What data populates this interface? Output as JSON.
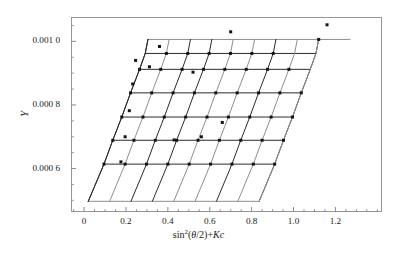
{
  "figure": {
    "kind": "zimm-plot",
    "background": "#ffffff"
  },
  "axes": {
    "x_label_parts": {
      "fn": "sin",
      "exponent": "2",
      "open": "(",
      "theta": "θ",
      "half": "/2",
      "close": ")",
      "plus": "+",
      "K": "K",
      "c": "c"
    },
    "y_label": "Y",
    "frame_color": "#8c8c8c",
    "tick_color": "#6e6e6e",
    "x_ticks": [
      {
        "value": 0,
        "label": "0"
      },
      {
        "value": 0.2,
        "label": "0.2"
      },
      {
        "value": 0.4,
        "label": "0.4"
      },
      {
        "value": 0.6,
        "label": "0.6"
      },
      {
        "value": 0.8,
        "label": "0.8"
      },
      {
        "value": 1.0,
        "label": "1.0"
      },
      {
        "value": 1.2,
        "label": "1.2"
      }
    ],
    "y_ticks": [
      {
        "value": 0.001,
        "label": "0.001 0"
      },
      {
        "value": 0.0008,
        "label": "0.000 8"
      },
      {
        "value": 0.0006,
        "label": "0.000 6"
      }
    ]
  },
  "chart_data": {
    "type": "scatter",
    "title": "",
    "xlabel": "sin²(θ/2)+Kc",
    "ylabel": "Y",
    "xlim": [
      -0.06,
      1.42
    ],
    "ylim": [
      0.000465,
      0.001075
    ],
    "grid": false,
    "legend": null,
    "marker": "filled-square",
    "marker_size_px": 3.0,
    "line_colors": [
      "#2b2b2b",
      "#8f8f8f"
    ],
    "angle_lines": [
      {
        "name": "c1",
        "color": "#2b2b2b",
        "points": [
          [
            0.02,
            0.000497
          ],
          [
            0.095,
            0.000614
          ],
          [
            0.137,
            0.000689
          ],
          [
            0.18,
            0.000762
          ],
          [
            0.222,
            0.000838
          ],
          [
            0.265,
            0.000912
          ],
          [
            0.292,
            0.000962
          ],
          [
            0.305,
            0.001006
          ]
        ]
      },
      {
        "name": "c2",
        "color": "#8f8f8f",
        "points": [
          [
            0.122,
            0.000497
          ],
          [
            0.196,
            0.000614
          ],
          [
            0.238,
            0.000689
          ],
          [
            0.281,
            0.000762
          ],
          [
            0.323,
            0.000838
          ],
          [
            0.366,
            0.000912
          ],
          [
            0.393,
            0.000962
          ],
          [
            0.406,
            0.001006
          ]
        ]
      },
      {
        "name": "c3",
        "color": "#2b2b2b",
        "points": [
          [
            0.224,
            0.000497
          ],
          [
            0.298,
            0.000614
          ],
          [
            0.34,
            0.000689
          ],
          [
            0.383,
            0.000762
          ],
          [
            0.425,
            0.000838
          ],
          [
            0.468,
            0.000912
          ],
          [
            0.495,
            0.000962
          ],
          [
            0.508,
            0.001006
          ]
        ]
      },
      {
        "name": "c4",
        "color": "#2b2b2b",
        "points": [
          [
            0.326,
            0.000497
          ],
          [
            0.4,
            0.000614
          ],
          [
            0.442,
            0.000689
          ],
          [
            0.485,
            0.000762
          ],
          [
            0.527,
            0.000838
          ],
          [
            0.57,
            0.000912
          ],
          [
            0.597,
            0.000962
          ],
          [
            0.61,
            0.001006
          ]
        ]
      },
      {
        "name": "c5",
        "color": "#8f8f8f",
        "points": [
          [
            0.428,
            0.000497
          ],
          [
            0.502,
            0.000614
          ],
          [
            0.544,
            0.000689
          ],
          [
            0.587,
            0.000762
          ],
          [
            0.629,
            0.000838
          ],
          [
            0.672,
            0.000912
          ],
          [
            0.699,
            0.000962
          ],
          [
            0.712,
            0.001006
          ]
        ]
      },
      {
        "name": "c6",
        "color": "#8f8f8f",
        "points": [
          [
            0.53,
            0.000497
          ],
          [
            0.604,
            0.000614
          ],
          [
            0.646,
            0.000689
          ],
          [
            0.689,
            0.000762
          ],
          [
            0.731,
            0.000838
          ],
          [
            0.774,
            0.000912
          ],
          [
            0.801,
            0.000962
          ],
          [
            0.814,
            0.001006
          ]
        ]
      },
      {
        "name": "c7",
        "color": "#2b2b2b",
        "points": [
          [
            0.632,
            0.000497
          ],
          [
            0.706,
            0.000614
          ],
          [
            0.748,
            0.000689
          ],
          [
            0.791,
            0.000762
          ],
          [
            0.833,
            0.000838
          ],
          [
            0.876,
            0.000912
          ],
          [
            0.903,
            0.000962
          ],
          [
            0.916,
            0.001006
          ]
        ]
      },
      {
        "name": "c8",
        "color": "#8f8f8f",
        "points": [
          [
            0.734,
            0.000497
          ],
          [
            0.808,
            0.000614
          ],
          [
            0.85,
            0.000689
          ],
          [
            0.893,
            0.000762
          ],
          [
            0.935,
            0.000838
          ],
          [
            0.978,
            0.000912
          ],
          [
            1.005,
            0.000962
          ],
          [
            1.018,
            0.001006
          ]
        ]
      },
      {
        "name": "c9",
        "color": "#2b2b2b",
        "points": [
          [
            0.836,
            0.000497
          ],
          [
            0.91,
            0.000614
          ],
          [
            0.952,
            0.000689
          ],
          [
            0.995,
            0.000762
          ],
          [
            1.037,
            0.000838
          ],
          [
            1.08,
            0.000912
          ],
          [
            1.107,
            0.000962
          ],
          [
            1.12,
            0.001006
          ]
        ]
      }
    ],
    "concentration_lines": [
      {
        "name": "q0",
        "color": "#8f8f8f",
        "points": [
          [
            0.02,
            0.000497
          ],
          [
            0.122,
            0.000497
          ],
          [
            0.224,
            0.000497
          ],
          [
            0.326,
            0.000497
          ],
          [
            0.428,
            0.000497
          ],
          [
            0.53,
            0.000497
          ],
          [
            0.632,
            0.000497
          ],
          [
            0.734,
            0.000497
          ],
          [
            0.836,
            0.000497
          ]
        ]
      },
      {
        "name": "q1",
        "color": "#2b2b2b",
        "points": [
          [
            0.095,
            0.000614
          ],
          [
            0.196,
            0.000614
          ],
          [
            0.298,
            0.000614
          ],
          [
            0.4,
            0.000614
          ],
          [
            0.502,
            0.000614
          ],
          [
            0.604,
            0.000614
          ],
          [
            0.706,
            0.000614
          ],
          [
            0.808,
            0.000614
          ],
          [
            0.91,
            0.000614
          ]
        ]
      },
      {
        "name": "q2",
        "color": "#2b2b2b",
        "points": [
          [
            0.137,
            0.000689
          ],
          [
            0.238,
            0.000689
          ],
          [
            0.34,
            0.000689
          ],
          [
            0.442,
            0.000689
          ],
          [
            0.544,
            0.000689
          ],
          [
            0.646,
            0.000689
          ],
          [
            0.748,
            0.000689
          ],
          [
            0.85,
            0.000689
          ],
          [
            0.952,
            0.000689
          ]
        ]
      },
      {
        "name": "q3",
        "color": "#2b2b2b",
        "points": [
          [
            0.18,
            0.000762
          ],
          [
            0.281,
            0.000762
          ],
          [
            0.383,
            0.000762
          ],
          [
            0.485,
            0.000762
          ],
          [
            0.587,
            0.000762
          ],
          [
            0.689,
            0.000762
          ],
          [
            0.791,
            0.000762
          ],
          [
            0.893,
            0.000762
          ],
          [
            0.995,
            0.000762
          ]
        ]
      },
      {
        "name": "q4",
        "color": "#2b2b2b",
        "points": [
          [
            0.222,
            0.000838
          ],
          [
            0.323,
            0.000838
          ],
          [
            0.425,
            0.000838
          ],
          [
            0.527,
            0.000838
          ],
          [
            0.629,
            0.000838
          ],
          [
            0.731,
            0.000838
          ],
          [
            0.833,
            0.000838
          ],
          [
            0.935,
            0.000838
          ],
          [
            1.037,
            0.000838
          ]
        ]
      },
      {
        "name": "q5",
        "color": "#2b2b2b",
        "points": [
          [
            0.265,
            0.000912
          ],
          [
            0.366,
            0.000912
          ],
          [
            0.468,
            0.000912
          ],
          [
            0.57,
            0.000912
          ],
          [
            0.672,
            0.000912
          ],
          [
            0.774,
            0.000912
          ],
          [
            0.876,
            0.000912
          ],
          [
            0.978,
            0.000912
          ],
          [
            1.08,
            0.000912
          ]
        ]
      },
      {
        "name": "q6",
        "color": "#2b2b2b",
        "points": [
          [
            0.292,
            0.000962
          ],
          [
            0.393,
            0.000962
          ],
          [
            0.495,
            0.000962
          ],
          [
            0.597,
            0.000962
          ],
          [
            0.699,
            0.000962
          ],
          [
            0.801,
            0.000962
          ],
          [
            0.903,
            0.000962
          ],
          [
            1.005,
            0.000962
          ],
          [
            1.107,
            0.000962
          ]
        ]
      },
      {
        "name": "q7",
        "color": "#8f8f8f",
        "points": [
          [
            0.305,
            0.001006
          ],
          [
            0.406,
            0.001006
          ],
          [
            0.508,
            0.001006
          ],
          [
            0.61,
            0.001006
          ],
          [
            0.712,
            0.001006
          ],
          [
            0.814,
            0.001006
          ],
          [
            0.916,
            0.001006
          ],
          [
            1.018,
            0.001006
          ],
          [
            1.12,
            0.001006
          ]
        ]
      }
    ],
    "left_envelope": {
      "name": "c-extrapolation",
      "color": "#2b2b2b",
      "points": [
        [
          0.02,
          0.000497
        ],
        [
          0.095,
          0.000614
        ],
        [
          0.137,
          0.000689
        ],
        [
          0.18,
          0.000762
        ],
        [
          0.222,
          0.000838
        ],
        [
          0.265,
          0.000912
        ],
        [
          0.292,
          0.000962
        ],
        [
          0.305,
          0.001006
        ]
      ]
    },
    "right_envelope": {
      "name": "theta-extrapolation",
      "color": "#8f8f8f",
      "points": [
        [
          0.836,
          0.000497
        ],
        [
          0.91,
          0.000614
        ],
        [
          0.952,
          0.000689
        ],
        [
          0.995,
          0.000762
        ],
        [
          1.037,
          0.000838
        ],
        [
          1.08,
          0.000912
        ],
        [
          1.107,
          0.000962
        ],
        [
          1.12,
          0.001006
        ],
        [
          1.27,
          0.001006
        ]
      ]
    },
    "markers": [
      [
        0.095,
        0.000614
      ],
      [
        0.137,
        0.000689
      ],
      [
        0.18,
        0.000762
      ],
      [
        0.222,
        0.000838
      ],
      [
        0.265,
        0.000912
      ],
      [
        0.196,
        0.000614
      ],
      [
        0.238,
        0.000689
      ],
      [
        0.281,
        0.000762
      ],
      [
        0.323,
        0.000838
      ],
      [
        0.366,
        0.000912
      ],
      [
        0.393,
        0.000962
      ],
      [
        0.298,
        0.000614
      ],
      [
        0.34,
        0.000689
      ],
      [
        0.383,
        0.000762
      ],
      [
        0.425,
        0.000838
      ],
      [
        0.468,
        0.000912
      ],
      [
        0.495,
        0.000962
      ],
      [
        0.4,
        0.000614
      ],
      [
        0.442,
        0.000689
      ],
      [
        0.485,
        0.000762
      ],
      [
        0.527,
        0.000838
      ],
      [
        0.57,
        0.000912
      ],
      [
        0.597,
        0.000962
      ],
      [
        0.502,
        0.000614
      ],
      [
        0.544,
        0.000689
      ],
      [
        0.587,
        0.000762
      ],
      [
        0.629,
        0.000838
      ],
      [
        0.672,
        0.000912
      ],
      [
        0.699,
        0.000962
      ],
      [
        0.604,
        0.000614
      ],
      [
        0.646,
        0.000689
      ],
      [
        0.689,
        0.000762
      ],
      [
        0.731,
        0.000838
      ],
      [
        0.774,
        0.000912
      ],
      [
        0.801,
        0.000962
      ],
      [
        0.706,
        0.000614
      ],
      [
        0.748,
        0.000689
      ],
      [
        0.791,
        0.000762
      ],
      [
        0.833,
        0.000838
      ],
      [
        0.876,
        0.000912
      ],
      [
        0.903,
        0.000962
      ],
      [
        0.808,
        0.000614
      ],
      [
        0.85,
        0.000689
      ],
      [
        0.893,
        0.000762
      ],
      [
        0.935,
        0.000838
      ],
      [
        0.978,
        0.000912
      ],
      [
        0.91,
        0.000614
      ],
      [
        0.952,
        0.000689
      ],
      [
        0.995,
        0.000762
      ],
      [
        1.037,
        0.000838
      ],
      [
        0.176,
        0.000621
      ],
      [
        0.196,
        0.0007
      ],
      [
        0.216,
        0.000782
      ],
      [
        0.232,
        0.000866
      ],
      [
        0.246,
        0.00094
      ],
      [
        0.36,
        0.000984
      ],
      [
        0.312,
        0.00092
      ],
      [
        0.52,
        0.000903
      ],
      [
        0.7,
        0.00103
      ],
      [
        1.16,
        0.001052
      ],
      [
        1.12,
        0.001006
      ],
      [
        0.43,
        0.00069
      ],
      [
        0.56,
        0.0007
      ],
      [
        0.66,
        0.000745
      ]
    ]
  }
}
